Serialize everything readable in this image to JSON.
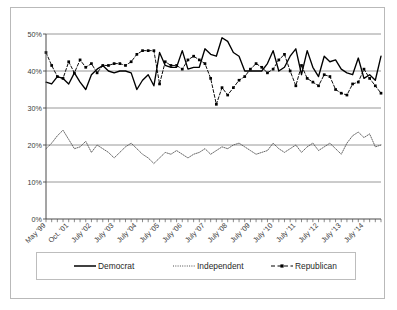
{
  "chart_data": {
    "type": "line",
    "title": "",
    "xlabel": "",
    "ylabel": "",
    "ylim": [
      0,
      50
    ],
    "ytick_labels": [
      "0%",
      "10%",
      "20%",
      "30%",
      "40%",
      "50%"
    ],
    "ytick_values": [
      0,
      10,
      20,
      30,
      40,
      50
    ],
    "grid": true,
    "legend_position": "bottom",
    "xtick_labels": [
      "May '99",
      "Oct. '01",
      "July '02",
      "July '03",
      "July '04",
      "July '05",
      "July '06",
      "July '07",
      "July '08",
      "July '09",
      "July '10",
      "July '11",
      "July '12",
      "July '13",
      "July '14"
    ],
    "xtick_indices": [
      0,
      4,
      8,
      12,
      16,
      20,
      24,
      28,
      32,
      36,
      40,
      44,
      48,
      52,
      56
    ],
    "n_points": 60,
    "series": [
      {
        "name": "Democrat",
        "style": "solid",
        "color": "#000000",
        "marker": "none",
        "values": [
          37.0,
          36.5,
          38.5,
          38.0,
          36.5,
          39.5,
          37.0,
          35.0,
          39.0,
          40.5,
          41.5,
          40.0,
          39.5,
          40.0,
          40.0,
          39.5,
          35.0,
          37.5,
          39.0,
          36.0,
          45.0,
          41.5,
          41.0,
          41.0,
          45.5,
          40.5,
          41.0,
          41.0,
          46.0,
          44.5,
          44.0,
          49.0,
          48.0,
          45.0,
          44.0,
          40.0,
          40.0,
          40.0,
          40.0,
          42.0,
          45.5,
          40.0,
          41.0,
          44.0,
          46.0,
          39.0,
          45.5,
          41.0,
          38.5,
          44.0,
          42.5,
          43.0,
          40.5,
          39.5,
          39.0,
          43.5,
          38.0,
          39.0,
          37.5,
          44.0
        ]
      },
      {
        "name": "Independent",
        "style": "dotted",
        "color": "#4d4d4d",
        "marker": "none",
        "values": [
          19.0,
          20.5,
          22.5,
          24.0,
          21.5,
          19.0,
          19.5,
          21.0,
          18.0,
          20.0,
          19.0,
          18.0,
          16.5,
          18.0,
          19.5,
          20.5,
          19.0,
          17.5,
          16.5,
          15.0,
          16.5,
          18.0,
          17.5,
          18.5,
          17.5,
          16.5,
          17.5,
          18.0,
          19.0,
          17.5,
          18.5,
          19.5,
          19.0,
          20.0,
          20.5,
          19.5,
          18.5,
          17.5,
          18.0,
          18.5,
          20.5,
          19.0,
          18.0,
          19.0,
          20.0,
          18.0,
          19.5,
          20.5,
          18.5,
          19.5,
          20.5,
          19.0,
          17.5,
          20.5,
          22.5,
          23.5,
          22.0,
          23.0,
          19.5,
          20.0
        ]
      },
      {
        "name": "Republican",
        "style": "dashed",
        "color": "#000000",
        "marker": "square",
        "values": [
          45.0,
          41.5,
          38.5,
          38.0,
          42.5,
          39.5,
          43.0,
          41.0,
          42.0,
          39.5,
          41.5,
          41.5,
          42.0,
          42.0,
          41.5,
          42.5,
          44.5,
          45.5,
          45.5,
          45.5,
          36.5,
          42.5,
          41.5,
          41.5,
          40.5,
          43.0,
          44.0,
          43.0,
          42.0,
          38.0,
          31.0,
          35.5,
          33.5,
          35.5,
          37.5,
          38.5,
          40.5,
          42.0,
          41.0,
          39.5,
          40.5,
          43.0,
          44.5,
          40.0,
          36.0,
          41.5,
          38.0,
          37.0,
          36.0,
          39.0,
          38.5,
          35.0,
          34.0,
          33.5,
          36.5,
          37.0,
          40.5,
          38.0,
          36.0,
          34.0
        ]
      }
    ]
  },
  "legend": {
    "items": [
      {
        "label": "Democrat",
        "style": "solid"
      },
      {
        "label": "Independent",
        "style": "dotted"
      },
      {
        "label": "Republican",
        "style": "dashed-marker"
      }
    ]
  }
}
